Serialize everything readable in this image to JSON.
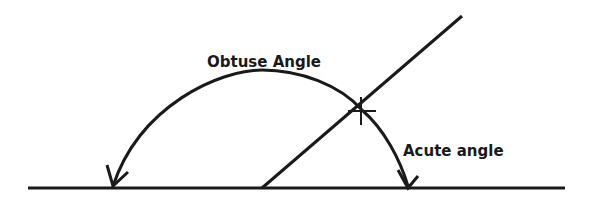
{
  "diagram": {
    "labels": {
      "obtuse": "Obtuse Angle",
      "acute": "Acute angle"
    },
    "colors": {
      "stroke": "#1a1a1a",
      "background": "#ffffff"
    }
  }
}
